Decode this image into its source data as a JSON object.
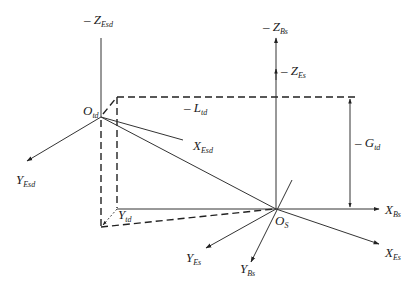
{
  "diagram": {
    "title": "",
    "colors": {
      "line": "#333333",
      "background": "#ffffff"
    },
    "origins": {
      "O_td": {
        "base": "O",
        "sub": "td"
      },
      "O_S": {
        "base": "O",
        "sub": "S"
      }
    },
    "axes": {
      "neg_Z_Esd": {
        "prefix": "– ",
        "base": "Z",
        "sub": "Esd"
      },
      "Y_Esd": {
        "base": "Y",
        "sub": "Esd"
      },
      "X_Esd": {
        "base": "X",
        "sub": "Esd"
      },
      "neg_Z_Bs": {
        "prefix": "– ",
        "base": "Z",
        "sub": "Bs"
      },
      "neg_Z_Es": {
        "prefix": "– ",
        "base": "Z",
        "sub": "Es"
      },
      "X_Bs": {
        "base": "X",
        "sub": "Bs"
      },
      "X_Es": {
        "base": "X",
        "sub": "Es"
      },
      "Y_Bs": {
        "base": "Y",
        "sub": "Bs"
      },
      "Y_Es": {
        "base": "Y",
        "sub": "Es"
      },
      "Y_td": {
        "base": "Y",
        "sub": "td"
      }
    },
    "dimensions": {
      "neg_L_td": {
        "prefix": "– ",
        "base": "L",
        "sub": "td"
      },
      "neg_G_td": {
        "prefix": "– ",
        "base": "G",
        "sub": "td"
      }
    }
  }
}
